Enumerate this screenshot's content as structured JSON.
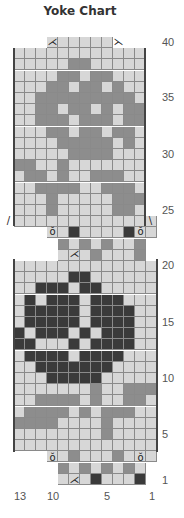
{
  "title": "Yoke Chart",
  "colors": {
    "light": "#d7d7d7",
    "medium": "#8d8d8d",
    "dark": "#3a3a3a",
    "grid": "#8a8a8a"
  },
  "row_labels": [
    {
      "text": "40",
      "y": 36
    },
    {
      "text": "35",
      "y": 91
    },
    {
      "text": "30",
      "y": 148
    },
    {
      "text": "25",
      "y": 204
    },
    {
      "text": "20",
      "y": 259
    },
    {
      "text": "15",
      "y": 316
    },
    {
      "text": "10",
      "y": 372
    },
    {
      "text": "5",
      "y": 428
    },
    {
      "text": "1",
      "y": 474
    }
  ],
  "col_labels": [
    {
      "text": "13",
      "x": 14
    },
    {
      "text": "10",
      "x": 47
    },
    {
      "text": "5",
      "x": 104
    },
    {
      "text": "1",
      "x": 149
    }
  ],
  "chart_data": {
    "type": "table",
    "title": "Yoke Chart",
    "legend": {
      "0": "light gray",
      "1": "medium gray",
      "2": "dark gray"
    },
    "rows": [
      {
        "row": 40,
        "x0": 47,
        "cells": "000000"
      },
      {
        "row": 39,
        "x0": 14,
        "cells": "000000000000"
      },
      {
        "row": 38,
        "x0": 14,
        "cells": "000001100000"
      },
      {
        "row": 37,
        "x0": 14,
        "cells": "000011011000"
      },
      {
        "row": 36,
        "x0": 14,
        "cells": "000110110100"
      },
      {
        "row": 35,
        "x0": 14,
        "cells": "001111111110"
      },
      {
        "row": 34,
        "x0": 14,
        "cells": "001101101011"
      },
      {
        "row": 33,
        "x0": 14,
        "cells": "001110111011"
      },
      {
        "row": 32,
        "x0": 14,
        "cells": "000110110110"
      },
      {
        "row": 31,
        "x0": 14,
        "cells": "000011111010"
      },
      {
        "row": 30,
        "x0": 14,
        "cells": "000001111000"
      },
      {
        "row": 29,
        "x0": 14,
        "cells": "110010000000"
      },
      {
        "row": 28,
        "x0": 14,
        "cells": "011010011100"
      },
      {
        "row": 27,
        "x0": 14,
        "cells": "001111001110"
      },
      {
        "row": 26,
        "x0": 14,
        "cells": "000100000111"
      },
      {
        "row": 25,
        "x0": 14,
        "cells": "000100000110"
      },
      {
        "row": 24,
        "x0": 14,
        "cells": "0000000000000"
      },
      {
        "row": 23,
        "x0": 47,
        "cells": "0020000200"
      },
      {
        "row": 22,
        "x0": 58,
        "cells": "10101001"
      },
      {
        "row": 21,
        "x0": 58,
        "cells": "00010001"
      },
      {
        "row": 20,
        "x0": 14,
        "cells": "0000000000000"
      },
      {
        "row": 19,
        "x0": 14,
        "cells": "0000022000000"
      },
      {
        "row": 18,
        "x0": 14,
        "cells": "0022202200000"
      },
      {
        "row": 17,
        "x0": 14,
        "cells": "0202220222000"
      },
      {
        "row": 16,
        "x0": 14,
        "cells": "0222220222200"
      },
      {
        "row": 15,
        "x0": 14,
        "cells": "0222220222200"
      },
      {
        "row": 14,
        "x0": 14,
        "cells": "2022202022200"
      },
      {
        "row": 13,
        "x0": 14,
        "cells": "2200020222200"
      },
      {
        "row": 12,
        "x0": 14,
        "cells": "0222202222000"
      },
      {
        "row": 11,
        "x0": 14,
        "cells": "0022222220000"
      },
      {
        "row": 10,
        "x0": 14,
        "cells": "0002222200000"
      },
      {
        "row": 9,
        "x0": 14,
        "cells": "0000000100111"
      },
      {
        "row": 8,
        "x0": 14,
        "cells": "0011110100110"
      },
      {
        "row": 7,
        "x0": 14,
        "cells": "0111101011100"
      },
      {
        "row": 6,
        "x0": 14,
        "cells": "1111000010000"
      },
      {
        "row": 5,
        "x0": 14,
        "cells": "0000000010000"
      },
      {
        "row": 4,
        "x0": 14,
        "cells": "0000000000000"
      },
      {
        "row": 3,
        "x0": 47,
        "cells": "0010001000"
      },
      {
        "row": 2,
        "x0": 58,
        "cells": "10101010"
      },
      {
        "row": 1,
        "x0": 58,
        "cells": "00020002"
      }
    ],
    "row_ticks": [
      40,
      35,
      30,
      25,
      20,
      15,
      10,
      5,
      1
    ],
    "col_ticks": [
      13,
      10,
      5,
      1
    ]
  },
  "symbols": [
    {
      "glyph": "⋌",
      "x": 47,
      "y": 36
    },
    {
      "glyph": "⋋",
      "x": 113,
      "y": 36
    },
    {
      "glyph": "/",
      "x": 3,
      "y": 215
    },
    {
      "glyph": "\\",
      "x": 145,
      "y": 215
    },
    {
      "glyph": "ŏ",
      "x": 47,
      "y": 226
    },
    {
      "glyph": "ŏ",
      "x": 135,
      "y": 226
    },
    {
      "glyph": "⋌",
      "x": 69,
      "y": 248
    },
    {
      "glyph": "ŏ",
      "x": 47,
      "y": 452
    },
    {
      "glyph": "ŏ",
      "x": 135,
      "y": 452
    },
    {
      "glyph": "⋌",
      "x": 69,
      "y": 474
    }
  ]
}
